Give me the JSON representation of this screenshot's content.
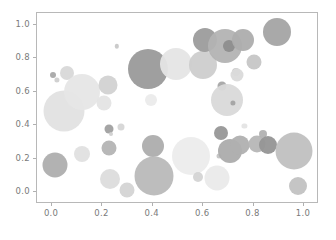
{
  "chart_data": {
    "type": "scatter",
    "title": "",
    "xlabel": "",
    "ylabel": "",
    "xlim": [
      -0.06,
      1.06
    ],
    "ylim": [
      -0.07,
      1.07
    ],
    "xticks": [
      0.0,
      0.2,
      0.4,
      0.6,
      0.8,
      1.0
    ],
    "yticks": [
      0.0,
      0.2,
      0.4,
      0.6,
      0.8,
      1.0
    ],
    "xticklabels": [
      "0.0",
      "0.2",
      "0.4",
      "0.6",
      "0.8",
      "1.0"
    ],
    "yticklabels": [
      "0.0",
      "0.2",
      "0.4",
      "0.6",
      "0.8",
      "1.0"
    ],
    "grid": false,
    "legend": null,
    "marker": "circle",
    "alpha": 0.5,
    "colormap": "gray",
    "points": [
      {
        "x": 0.005,
        "y": 0.7,
        "size": 3.0,
        "color": "#a8a8a8"
      },
      {
        "x": 0.02,
        "y": 0.672,
        "size": 2.6,
        "color": "#cfcfcf"
      },
      {
        "x": 0.058,
        "y": 0.713,
        "size": 7.0,
        "color": "#d8d8d8"
      },
      {
        "x": 0.013,
        "y": 0.163,
        "size": 12.5,
        "color": "#aeaeae"
      },
      {
        "x": 0.048,
        "y": 0.487,
        "size": 20.5,
        "color": "#e2e2e2"
      },
      {
        "x": 0.12,
        "y": 0.601,
        "size": 18.0,
        "color": "#e6e6e6"
      },
      {
        "x": 0.117,
        "y": 0.226,
        "size": 8.0,
        "color": "#e0e0e0"
      },
      {
        "x": 0.207,
        "y": 0.53,
        "size": 7.5,
        "color": "#e4e4e4"
      },
      {
        "x": 0.222,
        "y": 0.639,
        "size": 9.5,
        "color": "#d2d2d2"
      },
      {
        "x": 0.224,
        "y": 0.38,
        "size": 4.5,
        "color": "#a0a0a0"
      },
      {
        "x": 0.226,
        "y": 0.264,
        "size": 7.5,
        "color": "#b4b4b4"
      },
      {
        "x": 0.228,
        "y": 0.079,
        "size": 10.0,
        "color": "#dcdcdc"
      },
      {
        "x": 0.232,
        "y": 0.345,
        "size": 2.0,
        "color": "#d0d0d0"
      },
      {
        "x": 0.256,
        "y": 0.872,
        "size": 2.2,
        "color": "#c8c8c8"
      },
      {
        "x": 0.273,
        "y": 0.391,
        "size": 3.5,
        "color": "#d6d6d6"
      },
      {
        "x": 0.298,
        "y": 0.014,
        "size": 7.5,
        "color": "#d4d4d4"
      },
      {
        "x": 0.382,
        "y": 0.733,
        "size": 20.0,
        "color": "#9a9a9a"
      },
      {
        "x": 0.392,
        "y": 0.552,
        "size": 6.0,
        "color": "#ebebeb"
      },
      {
        "x": 0.402,
        "y": 0.276,
        "size": 11.0,
        "color": "#adadad"
      },
      {
        "x": 0.405,
        "y": 0.097,
        "size": 19.5,
        "color": "#b9b9b9"
      },
      {
        "x": 0.493,
        "y": 0.763,
        "size": 16.0,
        "color": "#e5e5e5"
      },
      {
        "x": 0.553,
        "y": 0.216,
        "size": 19.0,
        "color": "#ececec"
      },
      {
        "x": 0.58,
        "y": 0.09,
        "size": 5.0,
        "color": "#d4d4d4"
      },
      {
        "x": 0.598,
        "y": 0.762,
        "size": 14.0,
        "color": "#cdcdcd"
      },
      {
        "x": 0.607,
        "y": 0.906,
        "size": 12.0,
        "color": "#9c9c9c"
      },
      {
        "x": 0.654,
        "y": 0.087,
        "size": 12.5,
        "color": "#eaeaea"
      },
      {
        "x": 0.663,
        "y": 0.219,
        "size": 2.5,
        "color": "#c4c4c4"
      },
      {
        "x": 0.672,
        "y": 0.355,
        "size": 7.0,
        "color": "#979797"
      },
      {
        "x": 0.673,
        "y": 0.636,
        "size": 4.5,
        "color": "#a6a6a6"
      },
      {
        "x": 0.688,
        "y": 0.871,
        "size": 17.0,
        "color": "#b3b3b3"
      },
      {
        "x": 0.695,
        "y": 0.548,
        "size": 16.0,
        "color": "#d9d9d9"
      },
      {
        "x": 0.701,
        "y": 0.876,
        "size": 6.0,
        "color": "#8d8d8d"
      },
      {
        "x": 0.705,
        "y": 0.247,
        "size": 12.0,
        "color": "#acacac"
      },
      {
        "x": 0.718,
        "y": 0.533,
        "size": 2.6,
        "color": "#a3a3a3"
      },
      {
        "x": 0.731,
        "y": 0.718,
        "size": 4.0,
        "color": "#cacaca"
      },
      {
        "x": 0.733,
        "y": 0.697,
        "size": 6.5,
        "color": "#dadada"
      },
      {
        "x": 0.748,
        "y": 0.285,
        "size": 9.5,
        "color": "#b0b0b0"
      },
      {
        "x": 0.757,
        "y": 0.906,
        "size": 11.0,
        "color": "#adadad"
      },
      {
        "x": 0.764,
        "y": 0.394,
        "size": 2.6,
        "color": "#e4e4e4"
      },
      {
        "x": 0.8,
        "y": 0.776,
        "size": 7.5,
        "color": "#c6c6c6"
      },
      {
        "x": 0.812,
        "y": 0.289,
        "size": 8.5,
        "color": "#b6b6b6"
      },
      {
        "x": 0.838,
        "y": 0.347,
        "size": 4.0,
        "color": "#b2b2b2"
      },
      {
        "x": 0.856,
        "y": 0.281,
        "size": 9.0,
        "color": "#959595"
      },
      {
        "x": 0.895,
        "y": 0.959,
        "size": 14.0,
        "color": "#a4a4a4"
      },
      {
        "x": 0.962,
        "y": 0.245,
        "size": 18.5,
        "color": "#c0c0c0"
      },
      {
        "x": 0.978,
        "y": 0.035,
        "size": 9.0,
        "color": "#c2c2c2"
      }
    ]
  },
  "axes_geometry": {
    "left_px": 36,
    "top_px": 12,
    "width_px": 282,
    "height_px": 191
  }
}
